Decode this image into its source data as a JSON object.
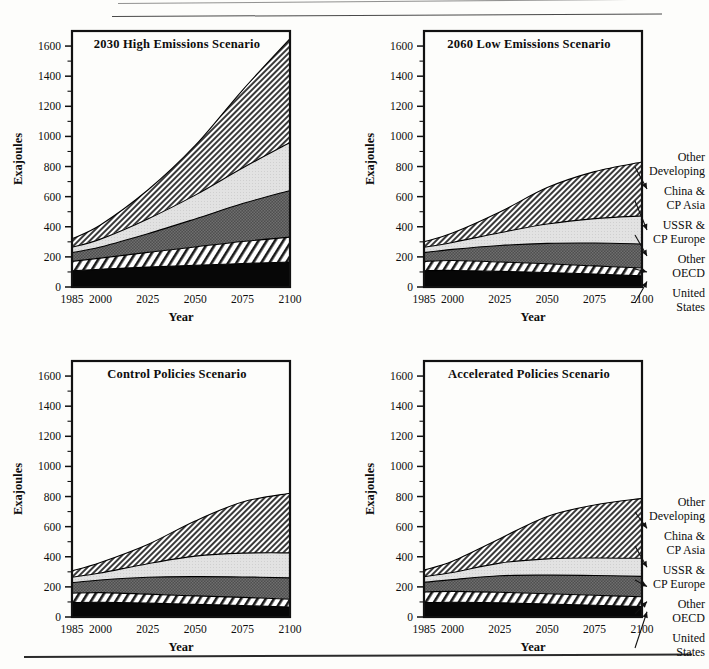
{
  "figure": {
    "y_axis_label": "Exajoules",
    "x_axis_label": "Year",
    "x_ticks": [
      "1985",
      "2000",
      "2025",
      "2050",
      "2075",
      "2100"
    ],
    "x_tick_values": [
      1985,
      2000,
      2025,
      2050,
      2075,
      2100
    ],
    "y_ticks": [
      "0",
      "200",
      "400",
      "600",
      "800",
      "1000",
      "1200",
      "1400",
      "1600"
    ],
    "y_tick_values": [
      0,
      200,
      400,
      600,
      800,
      1000,
      1200,
      1400,
      1600
    ],
    "xlim": [
      1985,
      2100
    ],
    "ylim": [
      0,
      1700
    ],
    "legend_labels": [
      {
        "line1": "Other",
        "line2": "Developing"
      },
      {
        "line1": "China &",
        "line2": "CP Asia"
      },
      {
        "line1": "USSR &",
        "line2": "CP Europe"
      },
      {
        "line1": "Other",
        "line2": "OECD"
      },
      {
        "line1": "United",
        "line2": "States"
      }
    ]
  },
  "chart_data": [
    {
      "type": "area",
      "panel": "top-left",
      "title": "2030 High Emissions Scenario",
      "xlabel": "Year",
      "ylabel": "Exajoules",
      "xlim": [
        1985,
        2100
      ],
      "ylim": [
        0,
        1700
      ],
      "grid": false,
      "x": [
        1985,
        2000,
        2025,
        2050,
        2075,
        2100
      ],
      "stack_order_bottom_to_top": [
        "United States",
        "Other OECD",
        "USSR & CP Europe",
        "China & CP Asia",
        "Other Developing"
      ],
      "series": [
        {
          "name": "United States",
          "fill": "solid-black",
          "values": [
            108,
            118,
            132,
            144,
            156,
            166
          ]
        },
        {
          "name": "Other OECD",
          "fill": "diagonal-stripe",
          "values": [
            62,
            74,
            98,
            122,
            146,
            165
          ]
        },
        {
          "name": "USSR & CP Europe",
          "fill": "dark-check",
          "values": [
            58,
            74,
            124,
            186,
            252,
            310
          ]
        },
        {
          "name": "China & CP Asia",
          "fill": "light-gray",
          "values": [
            36,
            52,
            98,
            158,
            236,
            318
          ]
        },
        {
          "name": "Other Developing",
          "fill": "dense-hatch",
          "values": [
            56,
            94,
            192,
            330,
            518,
            690
          ]
        }
      ],
      "cumulative_tops": [
        {
          "year": 1985,
          "us": 108,
          "oecd": 170,
          "ussr": 228,
          "china": 264,
          "total": 320
        },
        {
          "year": 2000,
          "us": 118,
          "oecd": 192,
          "ussr": 266,
          "china": 318,
          "total": 412
        },
        {
          "year": 2025,
          "us": 132,
          "oecd": 230,
          "ussr": 354,
          "china": 452,
          "total": 644
        },
        {
          "year": 2050,
          "us": 144,
          "oecd": 266,
          "ussr": 452,
          "china": 610,
          "total": 940
        },
        {
          "year": 2075,
          "us": 156,
          "oecd": 302,
          "ussr": 554,
          "china": 790,
          "total": 1308
        },
        {
          "year": 2100,
          "us": 166,
          "oecd": 331,
          "ussr": 641,
          "china": 959,
          "total": 1649
        }
      ]
    },
    {
      "type": "area",
      "panel": "top-right",
      "title": "2060 Low Emissions Scenario",
      "xlabel": "Year",
      "ylabel": "Exajoules",
      "xlim": [
        1985,
        2100
      ],
      "ylim": [
        0,
        1700
      ],
      "grid": false,
      "x": [
        1985,
        2000,
        2025,
        2050,
        2075,
        2100
      ],
      "stack_order_bottom_to_top": [
        "United States",
        "Other OECD",
        "USSR & CP Europe",
        "China & CP Asia",
        "Other Developing"
      ],
      "series": [
        {
          "name": "United States",
          "fill": "solid-black",
          "values": [
            108,
            110,
            104,
            96,
            86,
            74
          ]
        },
        {
          "name": "Other OECD",
          "fill": "diagonal-stripe",
          "values": [
            62,
            66,
            62,
            58,
            54,
            52
          ]
        },
        {
          "name": "USSR & CP Europe",
          "fill": "dark-check",
          "values": [
            58,
            74,
            110,
            136,
            152,
            160
          ]
        },
        {
          "name": "China & CP Asia",
          "fill": "light-gray",
          "values": [
            36,
            46,
            84,
            128,
            162,
            186
          ]
        },
        {
          "name": "Other Developing",
          "fill": "dense-hatch",
          "values": [
            36,
            62,
            138,
            242,
            312,
            358
          ]
        }
      ],
      "cumulative_tops": [
        {
          "year": 1985,
          "us": 108,
          "oecd": 170,
          "ussr": 228,
          "china": 264,
          "total": 300
        },
        {
          "year": 2000,
          "us": 110,
          "oecd": 176,
          "ussr": 250,
          "china": 296,
          "total": 358
        },
        {
          "year": 2025,
          "us": 104,
          "oecd": 166,
          "ussr": 276,
          "china": 360,
          "total": 498
        },
        {
          "year": 2050,
          "us": 96,
          "oecd": 154,
          "ussr": 290,
          "china": 418,
          "total": 660
        },
        {
          "year": 2075,
          "us": 86,
          "oecd": 140,
          "ussr": 292,
          "china": 454,
          "total": 766
        },
        {
          "year": 2100,
          "us": 74,
          "oecd": 126,
          "ussr": 286,
          "china": 472,
          "total": 830
        }
      ]
    },
    {
      "type": "area",
      "panel": "bottom-left",
      "title": "Control Policies Scenario",
      "xlabel": "Year",
      "ylabel": "Exajoules",
      "xlim": [
        1985,
        2100
      ],
      "ylim": [
        0,
        1700
      ],
      "grid": false,
      "x": [
        1985,
        2000,
        2025,
        2050,
        2075,
        2100
      ],
      "stack_order_bottom_to_top": [
        "United States",
        "Other OECD",
        "USSR & CP Europe",
        "China & CP Asia",
        "Other Developing"
      ],
      "series": [
        {
          "name": "United States",
          "fill": "solid-black",
          "values": [
            96,
            98,
            92,
            84,
            76,
            66
          ]
        },
        {
          "name": "Other OECD",
          "fill": "diagonal-stripe",
          "values": [
            62,
            64,
            60,
            56,
            54,
            52
          ]
        },
        {
          "name": "USSR & CP Europe",
          "fill": "dark-check",
          "values": [
            70,
            84,
            112,
            128,
            136,
            142
          ]
        },
        {
          "name": "China & CP Asia",
          "fill": "light-gray",
          "values": [
            36,
            46,
            90,
            136,
            158,
            166
          ]
        },
        {
          "name": "Other Developing",
          "fill": "dense-hatch",
          "values": [
            42,
            70,
            128,
            234,
            340,
            396
          ]
        }
      ],
      "cumulative_tops": [
        {
          "year": 1985,
          "us": 96,
          "oecd": 158,
          "ussr": 228,
          "china": 264,
          "total": 306
        },
        {
          "year": 2000,
          "us": 98,
          "oecd": 162,
          "ussr": 246,
          "china": 292,
          "total": 362
        },
        {
          "year": 2025,
          "us": 92,
          "oecd": 152,
          "ussr": 264,
          "china": 354,
          "total": 482
        },
        {
          "year": 2050,
          "us": 84,
          "oecd": 140,
          "ussr": 268,
          "china": 404,
          "total": 638
        },
        {
          "year": 2075,
          "us": 76,
          "oecd": 130,
          "ussr": 266,
          "china": 424,
          "total": 764
        },
        {
          "year": 2100,
          "us": 66,
          "oecd": 118,
          "ussr": 260,
          "china": 426,
          "total": 822
        }
      ]
    },
    {
      "type": "area",
      "panel": "bottom-right",
      "title": "Accelerated Policies Scenario",
      "xlabel": "Year",
      "ylabel": "Exajoules",
      "xlim": [
        1985,
        2100
      ],
      "ylim": [
        0,
        1700
      ],
      "grid": false,
      "x": [
        1985,
        2000,
        2025,
        2050,
        2075,
        2100
      ],
      "stack_order_bottom_to_top": [
        "United States",
        "Other OECD",
        "USSR & CP Europe",
        "China & CP Asia",
        "Other Developing"
      ],
      "series": [
        {
          "name": "United States",
          "fill": "solid-black",
          "values": [
            96,
            98,
            94,
            86,
            78,
            70
          ]
        },
        {
          "name": "Other OECD",
          "fill": "diagonal-stripe",
          "values": [
            70,
            72,
            70,
            68,
            66,
            64
          ]
        },
        {
          "name": "USSR & CP Europe",
          "fill": "dark-check",
          "values": [
            64,
            78,
            110,
            124,
            132,
            136
          ]
        },
        {
          "name": "China & CP Asia",
          "fill": "light-gray",
          "values": [
            38,
            48,
            84,
            108,
            116,
            120
          ]
        },
        {
          "name": "Other Developing",
          "fill": "dense-hatch",
          "values": [
            44,
            74,
            162,
            282,
            352,
            398
          ]
        }
      ],
      "cumulative_tops": [
        {
          "year": 1985,
          "us": 96,
          "oecd": 166,
          "ussr": 230,
          "china": 268,
          "total": 312
        },
        {
          "year": 2000,
          "us": 98,
          "oecd": 170,
          "ussr": 248,
          "china": 296,
          "total": 370
        },
        {
          "year": 2025,
          "us": 94,
          "oecd": 164,
          "ussr": 274,
          "china": 358,
          "total": 520
        },
        {
          "year": 2050,
          "us": 86,
          "oecd": 154,
          "ussr": 278,
          "china": 386,
          "total": 668
        },
        {
          "year": 2075,
          "us": 78,
          "oecd": 144,
          "ussr": 276,
          "china": 392,
          "total": 744
        },
        {
          "year": 2100,
          "us": 70,
          "oecd": 134,
          "ussr": 270,
          "china": 390,
          "total": 788
        }
      ]
    }
  ]
}
